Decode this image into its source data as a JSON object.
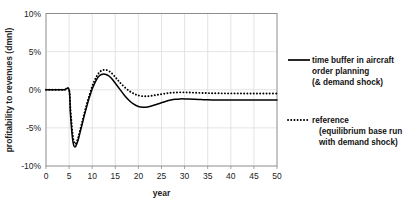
{
  "chart_data": {
    "type": "line",
    "title": "",
    "xlabel": "year",
    "ylabel": "profitability to revenues (dmnl)",
    "xlim": [
      0,
      50
    ],
    "ylim": [
      -10,
      10
    ],
    "grid": true,
    "legend_position": "right",
    "xticks": [
      "0",
      "5",
      "10",
      "15",
      "20",
      "25",
      "30",
      "35",
      "40",
      "45",
      "50"
    ],
    "xtick_values": [
      0,
      5,
      10,
      15,
      20,
      25,
      30,
      35,
      40,
      45,
      50
    ],
    "yticks": [
      "10%",
      "5%",
      "0%",
      "-5%",
      "-10%"
    ],
    "ytick_values": [
      10,
      5,
      0,
      -5,
      -10
    ],
    "series": [
      {
        "name": "time buffer in aircraft order planning (& demand shock)",
        "style": "solid",
        "color": "#000000",
        "x": [
          0,
          1,
          2,
          3,
          4,
          5,
          5.3,
          5.7,
          6,
          6.3,
          6.6,
          7,
          7.5,
          8,
          8.5,
          9,
          9.5,
          10,
          10.5,
          11,
          11.5,
          12,
          12.5,
          13,
          13.5,
          14,
          14.5,
          15,
          15.5,
          16,
          17,
          18,
          19,
          20,
          21,
          22,
          23,
          24,
          25,
          26,
          27,
          28,
          29,
          30,
          31,
          32,
          33,
          34,
          35,
          36,
          38,
          40,
          42,
          44,
          46,
          48,
          50
        ],
        "y": [
          0,
          0,
          0,
          0,
          0,
          0,
          -3.2,
          -6.2,
          -7.3,
          -7.5,
          -7.2,
          -6.5,
          -5.3,
          -4.1,
          -2.9,
          -1.8,
          -0.8,
          0.1,
          0.8,
          1.4,
          1.8,
          2.0,
          2.05,
          2.0,
          1.85,
          1.6,
          1.25,
          0.85,
          0.45,
          0.05,
          -0.75,
          -1.4,
          -1.9,
          -2.2,
          -2.3,
          -2.25,
          -2.1,
          -1.9,
          -1.7,
          -1.5,
          -1.35,
          -1.25,
          -1.2,
          -1.2,
          -1.22,
          -1.25,
          -1.28,
          -1.3,
          -1.32,
          -1.33,
          -1.34,
          -1.35,
          -1.35,
          -1.35,
          -1.35,
          -1.35,
          -1.35
        ]
      },
      {
        "name": "reference (equilibrium base run with demand shock)",
        "style": "dotted",
        "color": "#000000",
        "x": [
          0,
          1,
          2,
          3,
          4,
          5,
          5.3,
          5.7,
          6,
          6.3,
          6.6,
          7,
          7.5,
          8,
          8.5,
          9,
          9.5,
          10,
          10.5,
          11,
          11.5,
          12,
          12.5,
          13,
          13.5,
          14,
          14.5,
          15,
          15.5,
          16,
          17,
          18,
          19,
          20,
          21,
          22,
          23,
          24,
          25,
          26,
          27,
          28,
          29,
          30,
          31,
          32,
          33,
          34,
          35,
          36,
          38,
          40,
          42,
          44,
          46,
          48,
          50
        ],
        "y": [
          0,
          0,
          0,
          0,
          0,
          0,
          -2.6,
          -5.4,
          -6.7,
          -7.1,
          -6.9,
          -6.2,
          -5.0,
          -3.8,
          -2.6,
          -1.5,
          -0.5,
          0.45,
          1.2,
          1.8,
          2.25,
          2.5,
          2.6,
          2.6,
          2.5,
          2.3,
          2.0,
          1.65,
          1.3,
          0.95,
          0.35,
          -0.15,
          -0.5,
          -0.75,
          -0.85,
          -0.85,
          -0.78,
          -0.68,
          -0.58,
          -0.48,
          -0.4,
          -0.36,
          -0.34,
          -0.34,
          -0.36,
          -0.38,
          -0.4,
          -0.42,
          -0.44,
          -0.45,
          -0.47,
          -0.48,
          -0.48,
          -0.49,
          -0.49,
          -0.5,
          -0.5
        ]
      }
    ]
  },
  "legend": {
    "items": [
      {
        "style": "solid",
        "lines": [
          "time buffer in aircraft",
          "order planning",
          "(& demand shock)"
        ]
      },
      {
        "style": "dotted",
        "lines": [
          "reference",
          "(equilibrium base run",
          "with demand shock)"
        ]
      }
    ]
  }
}
